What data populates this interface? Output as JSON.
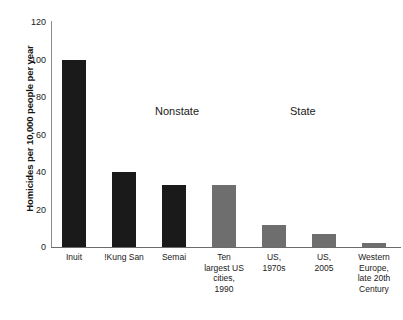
{
  "chart_data": {
    "type": "bar",
    "title": "",
    "xlabel": "",
    "ylabel": "Homicides per 10,000 people per year",
    "ylim": [
      0,
      120
    ],
    "yticks": [
      0,
      20,
      40,
      60,
      80,
      100,
      120
    ],
    "ytick_labels": [
      "0",
      "20",
      "40",
      "60",
      "80",
      "100",
      "120"
    ],
    "grid": false,
    "legend": null,
    "categories": [
      "Inuit",
      "!Kung San",
      "Semai",
      "Ten largest US cities, 1990",
      "US, 1970s",
      "US, 2005",
      "Western Europe, late 20th Century"
    ],
    "category_label_lines": [
      [
        "Inuit"
      ],
      [
        "!Kung San"
      ],
      [
        "Semai"
      ],
      [
        "Ten",
        "largest US",
        "cities,",
        "1990"
      ],
      [
        "US,",
        "1970s"
      ],
      [
        "US,",
        "2005"
      ],
      [
        "Western",
        "Europe,",
        "late 20th",
        "Century"
      ]
    ],
    "values": [
      100,
      40,
      33,
      33,
      12,
      7,
      2
    ],
    "bar_colors": [
      "#1a1a1a",
      "#1a1a1a",
      "#1a1a1a",
      "#6e6e6e",
      "#6e6e6e",
      "#6e6e6e",
      "#6e6e6e"
    ],
    "annotations": [
      {
        "text": "Nonstate",
        "x_px": 155,
        "y_px": 105
      },
      {
        "text": "State",
        "x_px": 290,
        "y_px": 105
      }
    ],
    "colors": {
      "nonstate_bar": "#1a1a1a",
      "state_bar": "#6e6e6e",
      "axis": "#6b6b6b",
      "background": "#ffffff",
      "text": "#1a1a1a"
    }
  }
}
